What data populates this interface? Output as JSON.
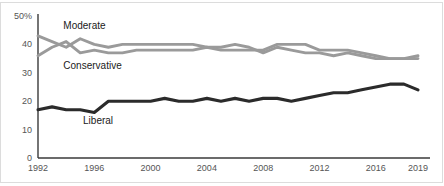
{
  "chart_data": {
    "type": "line",
    "title": "",
    "subtitle": "",
    "xlabel": "",
    "ylabel": "",
    "xlim": [
      1992,
      2019
    ],
    "ylim": [
      0,
      50
    ],
    "grid": false,
    "legend_position": "inline-labels",
    "x": [
      1992,
      1993,
      1994,
      1995,
      1996,
      1997,
      1998,
      1999,
      2000,
      2001,
      2002,
      2003,
      2004,
      2005,
      2006,
      2007,
      2008,
      2009,
      2010,
      2011,
      2012,
      2013,
      2014,
      2015,
      2016,
      2017,
      2018,
      2019
    ],
    "y_ticks": [
      "0",
      "10",
      "20",
      "30",
      "40",
      "50%"
    ],
    "y_tick_values": [
      0,
      10,
      20,
      30,
      40,
      50
    ],
    "x_ticks": [
      "1992",
      "1996",
      "2000",
      "2004",
      "2008",
      "2012",
      "2016",
      "2019"
    ],
    "x_tick_values": [
      1992,
      1996,
      2000,
      2004,
      2008,
      2012,
      2016,
      2019
    ],
    "series": [
      {
        "name": "Moderate",
        "color": "#9a9a9a",
        "label_x": 1993.8,
        "label_y": 46.5,
        "values": [
          43,
          41,
          39,
          42,
          40,
          39,
          40,
          40,
          40,
          40,
          40,
          40,
          39,
          39,
          40,
          39,
          37,
          39,
          38,
          37,
          37,
          36,
          37,
          36,
          35,
          35,
          35,
          36
        ]
      },
      {
        "name": "Conservative",
        "color": "#9a9a9a",
        "label_x": 1993.8,
        "label_y": 32.5,
        "values": [
          36,
          39,
          41,
          37,
          38,
          37,
          37,
          38,
          38,
          38,
          38,
          38,
          39,
          38,
          38,
          38,
          38,
          40,
          40,
          40,
          38,
          38,
          38,
          37,
          36,
          35,
          35,
          35
        ]
      },
      {
        "name": "Liberal",
        "color": "#2b2b2b",
        "label_x": 1995.2,
        "label_y": 13.0,
        "values": [
          17,
          18,
          17,
          17,
          16,
          20,
          20,
          20,
          20,
          21,
          20,
          20,
          21,
          20,
          21,
          20,
          21,
          21,
          20,
          21,
          22,
          23,
          23,
          24,
          25,
          26,
          26,
          24
        ]
      }
    ]
  }
}
